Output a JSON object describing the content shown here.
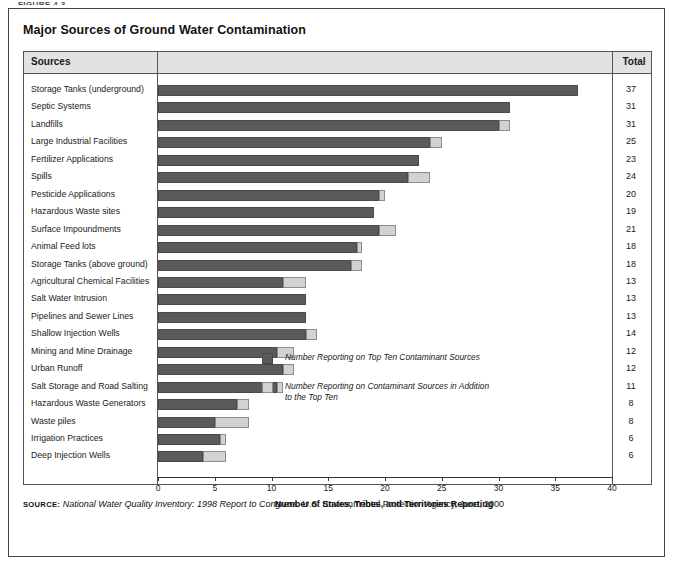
{
  "figure_label": "FIGURE 4.3",
  "title": "Major Sources of Ground Water Contamination",
  "table": {
    "header_sources": "Sources",
    "header_total": "Total"
  },
  "legend": {
    "items": [
      {
        "name": "legend-dark",
        "color": "#5a5a5a",
        "label": "Number Reporting on Top Ten Contaminant Sources"
      },
      {
        "name": "legend-light",
        "color": "#d2d2d2",
        "label": "Number Reporting on Contaminant Sources in Addition to the Top Ten"
      }
    ]
  },
  "source_note": {
    "keyword": "SOURCE:",
    "italic_part": "National Water Quality Inventory: 1998 Report to Congress.",
    "rest": " U.S. Environmental Protection Agency, June, 2000"
  },
  "chart_data": {
    "type": "bar",
    "orientation": "horizontal",
    "stacked": true,
    "title": "Major Sources of Ground Water Contamination",
    "xlabel": "Number of States, Tribes, and Territories Reporting",
    "ylabel": "Sources",
    "xlim": [
      0,
      40
    ],
    "xticks": [
      0,
      5,
      10,
      15,
      20,
      25,
      30,
      35,
      40
    ],
    "grid": false,
    "legend_position": "inside-right",
    "categories": [
      "Storage Tanks (underground)",
      "Septic Systems",
      "Landfills",
      "Large Industrial Facilities",
      "Fertilizer Applications",
      "Spills",
      "Pesticide Applications",
      "Hazardous Waste sites",
      "Surface Impoundments",
      "Animal Feed lots",
      "Storage Tanks (above ground)",
      "Agricultural Chemical Facilities",
      "Salt Water Intrusion",
      "Pipelines and Sewer Lines",
      "Shallow Injection Wells",
      "Mining and Mine Drainage",
      "Urban Runoff",
      "Salt Storage and Road Salting",
      "Hazardous Waste Generators",
      "Waste piles",
      "Irrigation Practices",
      "Deep Injection Wells"
    ],
    "series": [
      {
        "name": "Number Reporting on Top Ten Contaminant Sources",
        "color": "#5a5a5a",
        "values": [
          37,
          31,
          30,
          24,
          23,
          22,
          19.5,
          19,
          19.5,
          17.5,
          17,
          11,
          13,
          13,
          13,
          10.5,
          11,
          10.5,
          7,
          5,
          5.5,
          4
        ]
      },
      {
        "name": "Number Reporting on Contaminant Sources in Addition to the Top Ten",
        "color": "#d2d2d2",
        "values": [
          0,
          0,
          1,
          1,
          0,
          2,
          0.5,
          0,
          1.5,
          0.5,
          1,
          2,
          0,
          0,
          1,
          1.5,
          1,
          0.5,
          1,
          3,
          0.5,
          2
        ]
      }
    ],
    "totals": [
      37,
      31,
      31,
      25,
      23,
      24,
      20,
      19,
      21,
      18,
      18,
      13,
      13,
      13,
      14,
      12,
      12,
      11,
      8,
      8,
      6,
      6
    ]
  }
}
